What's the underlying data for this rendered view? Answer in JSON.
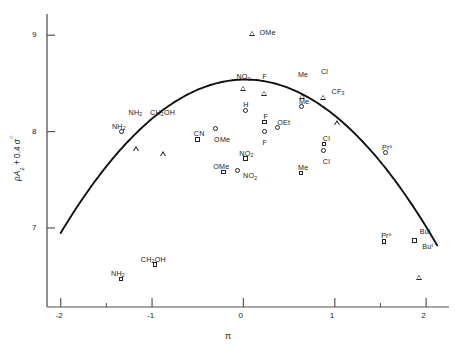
{
  "chart_data": {
    "type": "scatter",
    "title": "",
    "xlabel": "π",
    "ylabel": "pA2 + 0.4 σ°",
    "xlim": [
      -2.15,
      2.25
    ],
    "ylim": [
      6.18,
      9.22
    ],
    "xticks": [
      -2,
      -1,
      0,
      1,
      2
    ],
    "xtick_labels": [
      "-2",
      "-1",
      "0",
      "1",
      "2"
    ],
    "yticks": [
      7,
      8,
      9
    ],
    "ytick_labels": [
      "7",
      "8",
      "9"
    ],
    "minor_xticks": [
      -1.5,
      1.5
    ],
    "grid": false,
    "legend": null,
    "series": [
      {
        "name": "circle",
        "marker": "circle",
        "points": [
          {
            "label": "NH2",
            "x": -1.33,
            "y": 8.0,
            "lx": -10,
            "ly": -9
          },
          {
            "label": "H",
            "x": 0.02,
            "y": 8.22,
            "lx": -2,
            "ly": -9
          },
          {
            "label": "OMe",
            "x": -0.31,
            "y": 8.03,
            "lx": -1,
            "ly": 7
          },
          {
            "label": "F",
            "x": 0.23,
            "y": 8.0,
            "lx": -2,
            "ly": 7
          },
          {
            "label": "OEt",
            "x": 0.37,
            "y": 8.04,
            "lx": 0,
            "ly": -9
          },
          {
            "label": "Me",
            "x": 0.64,
            "y": 8.26,
            "lx": -3,
            "ly": -9
          },
          {
            "label": "Cl",
            "x": 0.88,
            "y": 7.8,
            "lx": -1,
            "ly": 7
          },
          {
            "label": "NO2",
            "x": -0.07,
            "y": 7.6,
            "lx": 6,
            "ly": 2
          },
          {
            "label": "Prⁿ",
            "x": 1.55,
            "y": 7.78,
            "lx": -3,
            "ly": -9
          }
        ]
      },
      {
        "name": "square",
        "marker": "square",
        "points": [
          {
            "label": "CN",
            "x": -0.5,
            "y": 7.92,
            "lx": -4,
            "ly": -9
          },
          {
            "label": "F",
            "x": 0.23,
            "y": 8.1,
            "lx": -1,
            "ly": -9
          },
          {
            "label": "NO2",
            "x": 0.02,
            "y": 7.72,
            "lx": -6,
            "ly": -9
          },
          {
            "label": "OMe",
            "x": -0.22,
            "y": 7.58,
            "lx": -10,
            "ly": -9
          },
          {
            "label": "Me",
            "x": 0.63,
            "y": 7.57,
            "lx": -3,
            "ly": -9
          },
          {
            "label": "Cl",
            "x": 0.88,
            "y": 7.87,
            "lx": -1,
            "ly": -9
          },
          {
            "label": "CH2OH",
            "x": -0.97,
            "y": 6.62,
            "lx": -14,
            "ly": -9
          },
          {
            "label": "NH2",
            "x": -1.34,
            "y": 6.47,
            "lx": -10,
            "ly": -9
          },
          {
            "label": "Prⁿ",
            "x": 1.54,
            "y": 6.86,
            "lx": -3,
            "ly": -9
          },
          {
            "label": "Buᵗ",
            "x": 1.87,
            "y": 6.87,
            "lx": 8,
            "ly": 3
          }
        ]
      },
      {
        "name": "triangle",
        "marker": "triangle",
        "points": [
          {
            "label": "OMe",
            "x": 0.1,
            "y": 9.02,
            "lx": 7,
            "ly": -4
          },
          {
            "label": "NO2",
            "x": 0.0,
            "y": 8.5,
            "lx": -7,
            "ly": -10
          },
          {
            "label": "F",
            "x": 0.23,
            "y": 8.5,
            "lx": -2,
            "ly": -10
          },
          {
            "label": "Me",
            "x": 0.64,
            "y": 8.52,
            "lx": -4,
            "ly": -10
          },
          {
            "label": "Cl",
            "x": 0.87,
            "y": 8.56,
            "lx": -2,
            "ly": -10
          },
          {
            "label": "CF3",
            "x": 1.03,
            "y": 8.35,
            "lx": -6,
            "ly": -10
          },
          {
            "label": "NH2",
            "x": -1.17,
            "y": 8.13,
            "lx": -8,
            "ly": -10
          },
          {
            "label": "CH2OH",
            "x": -0.88,
            "y": 8.13,
            "lx": -13,
            "ly": -10
          },
          {
            "label": "Buᵗ",
            "x": 1.92,
            "y": 6.9,
            "lx": 1,
            "ly": -10
          }
        ]
      }
    ],
    "fit_curve": {
      "description": "downward parabola fit",
      "vertex_x": 0.02,
      "vertex_y": 8.54,
      "curvature": -0.39,
      "x_start": -2.0,
      "x_end": 2.12
    }
  },
  "axes": {
    "x_axis_label": "π",
    "y_axis_label_parts": {
      "p": "p",
      "A": "A",
      "sub2": "2",
      "plus": " + 0.4 ",
      "sigma": "σ",
      "sup": "○"
    }
  },
  "caption": {
    "text": ""
  }
}
